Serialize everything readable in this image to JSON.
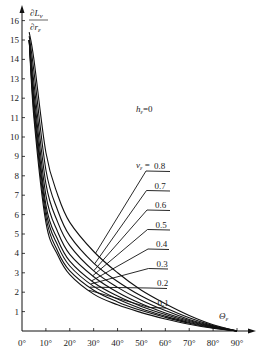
{
  "chart_data": {
    "type": "line",
    "title": "",
    "ylabel": "∂L_ν / ∂r_ε",
    "xlabel": "Θ_ε",
    "annotation": "h_ε=0",
    "legend_prefix": "ν_ε =",
    "xlim": [
      0,
      90
    ],
    "ylim": [
      0,
      16
    ],
    "x_ticks": [
      "0°",
      "10°",
      "20°",
      "30°",
      "40°",
      "50°",
      "60°",
      "70°",
      "80°",
      "90°"
    ],
    "y_ticks": [
      "1",
      "2",
      "3",
      "4",
      "5",
      "6",
      "7",
      "8",
      "9",
      "10",
      "11",
      "12",
      "13",
      "14",
      "15",
      "16"
    ],
    "grid": false,
    "x": [
      3,
      5,
      10,
      15,
      20,
      30,
      40,
      50,
      60,
      70,
      80,
      90
    ],
    "series": [
      {
        "name": "0.1",
        "values": [
          15.0,
          11.0,
          5.6,
          3.9,
          2.9,
          1.9,
          1.35,
          0.95,
          0.62,
          0.35,
          0.14,
          0.0
        ]
      },
      {
        "name": "0.2",
        "values": [
          15.0,
          11.3,
          5.9,
          4.1,
          3.1,
          2.1,
          1.5,
          1.05,
          0.7,
          0.4,
          0.16,
          0.0
        ]
      },
      {
        "name": "0.3",
        "values": [
          15.0,
          11.6,
          6.2,
          4.4,
          3.35,
          2.3,
          1.65,
          1.15,
          0.77,
          0.44,
          0.18,
          0.0
        ]
      },
      {
        "name": "0.4",
        "values": [
          15.0,
          11.9,
          6.5,
          4.7,
          3.6,
          2.5,
          1.8,
          1.27,
          0.85,
          0.49,
          0.2,
          0.0
        ]
      },
      {
        "name": "0.5",
        "values": [
          15.0,
          12.3,
          7.0,
          5.1,
          3.95,
          2.8,
          2.0,
          1.4,
          0.93,
          0.54,
          0.22,
          0.0
        ]
      },
      {
        "name": "0.6",
        "values": [
          15.0,
          12.8,
          7.6,
          5.6,
          4.4,
          3.1,
          2.25,
          1.58,
          1.05,
          0.6,
          0.25,
          0.0
        ]
      },
      {
        "name": "0.7",
        "values": [
          15.2,
          13.4,
          8.3,
          6.2,
          4.9,
          3.5,
          2.55,
          1.8,
          1.2,
          0.68,
          0.28,
          0.0
        ]
      },
      {
        "name": "0.8",
        "values": [
          15.4,
          14.0,
          9.2,
          7.0,
          5.6,
          4.1,
          3.0,
          2.1,
          1.4,
          0.8,
          0.32,
          0.0
        ]
      }
    ],
    "legend_position": "right, leader lines from curves near Θ_ε≈30°"
  }
}
